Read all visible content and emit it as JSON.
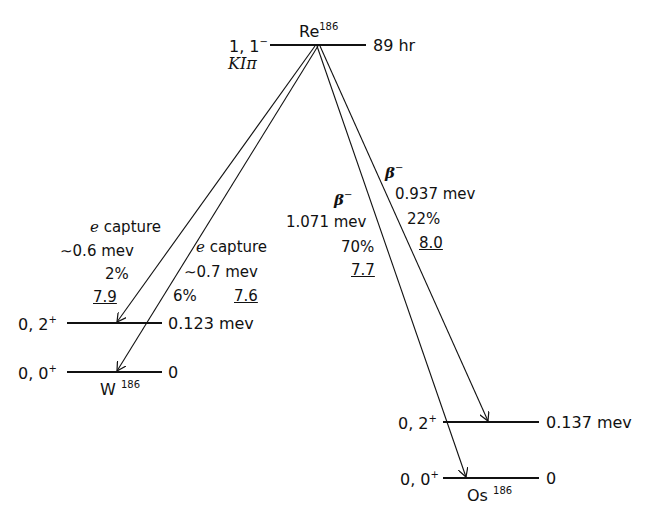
{
  "parent": {
    "nucleus": "Re",
    "mass": "186",
    "spin_label": "1, 1",
    "spin_parity": "−",
    "class_label": "KIπ",
    "half_life": "89 hr"
  },
  "daughters": {
    "W": {
      "nucleus": "W",
      "mass": "186",
      "levels": [
        {
          "spin_label": "0, 2",
          "parity": "+",
          "energy": "0.123 mev"
        },
        {
          "spin_label": "0, 0",
          "parity": "+",
          "energy": "0"
        }
      ]
    },
    "Os": {
      "nucleus": "Os",
      "mass": "186",
      "levels": [
        {
          "spin_label": "0, 2",
          "parity": "+",
          "energy": "0.137 mev"
        },
        {
          "spin_label": "0, 0",
          "parity": "+",
          "energy": "0"
        }
      ]
    }
  },
  "transitions": [
    {
      "mode": "e capture",
      "energy": "∼0.6 mev",
      "branch": "2%",
      "log_ft": "7.9",
      "to": "W 0.123 mev"
    },
    {
      "mode": "e capture",
      "energy": "∼0.7 mev",
      "branch": "6%",
      "log_ft": "7.6",
      "to": "W 0"
    },
    {
      "mode": "β",
      "mode_sign": "−",
      "energy": "1.071 mev",
      "branch": "70%",
      "log_ft": "7.7",
      "to": "Os 0"
    },
    {
      "mode": "β",
      "mode_sign": "−",
      "energy": "0.937 mev",
      "branch": "22%",
      "log_ft": "8.0",
      "to": "Os 0.137 mev"
    }
  ]
}
